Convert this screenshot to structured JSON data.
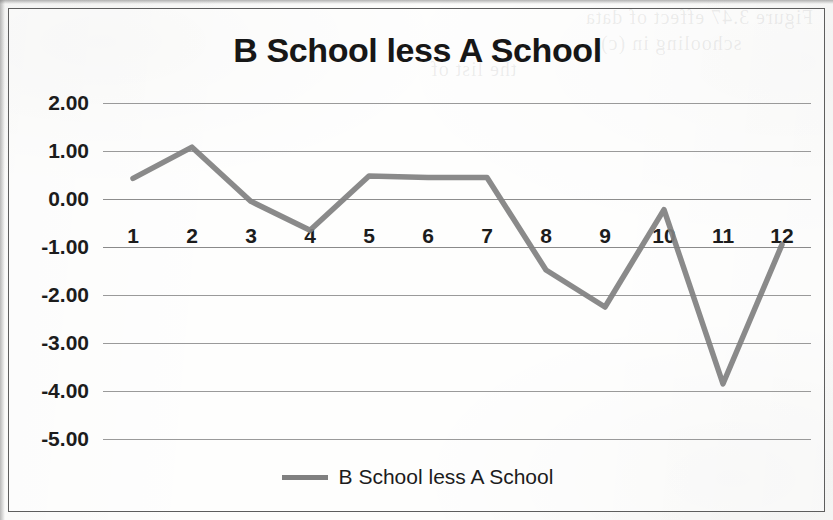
{
  "chart_data": {
    "type": "line",
    "title": "B School less A School",
    "xlabel": "",
    "ylabel": "",
    "categories": [
      "1",
      "2",
      "3",
      "4",
      "5",
      "6",
      "7",
      "8",
      "9",
      "10",
      "11",
      "12"
    ],
    "series": [
      {
        "name": "B School less A School",
        "color": "#808080",
        "values": [
          0.43,
          1.08,
          -0.05,
          -0.65,
          0.48,
          0.45,
          0.45,
          -1.48,
          -2.25,
          -0.22,
          -3.85,
          -0.95
        ]
      }
    ],
    "ylim": [
      -5.0,
      2.0
    ],
    "ytick_step": 1.0,
    "ytick_labels": [
      "2.00",
      "1.00",
      "0.00",
      "-1.00",
      "-2.00",
      "-3.00",
      "-4.00",
      "-5.00"
    ],
    "ytick_values": [
      2.0,
      1.0,
      0.0,
      -1.0,
      -2.0,
      -3.0,
      -4.0,
      -5.0
    ],
    "grid": true,
    "legend_position": "bottom",
    "category_axis_at": -1.0
  },
  "legend": {
    "entries": [
      {
        "label": "B School less A School",
        "color": "#808080"
      }
    ]
  },
  "artifacts": {
    "bleed_lines": [
      {
        "text": "Figure 3.47  effect of data",
        "left": 585,
        "top": 6
      },
      {
        "text": "schooling  in (c)",
        "left": 600,
        "top": 32
      },
      {
        "text": "the list of",
        "left": 430,
        "top": 58
      }
    ]
  }
}
